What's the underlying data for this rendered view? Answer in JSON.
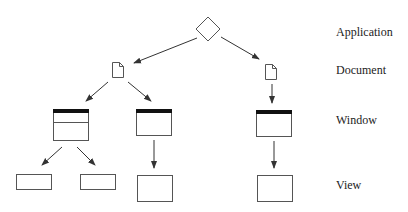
{
  "diagram": {
    "levels": [
      {
        "id": "application",
        "label": "Application",
        "y": 26
      },
      {
        "id": "document",
        "label": "Document",
        "y": 64
      },
      {
        "id": "window",
        "label": "Window",
        "y": 114
      },
      {
        "id": "view",
        "label": "View",
        "y": 179
      }
    ],
    "nodes": {
      "application": {
        "type": "diamond",
        "cx": 208,
        "cy": 29
      },
      "documents": [
        {
          "x": 111,
          "y": 61
        },
        {
          "x": 265,
          "y": 64
        }
      ],
      "windows": [
        {
          "x": 53,
          "y": 109,
          "w": 35,
          "h": 31,
          "panes": 3
        },
        {
          "x": 136,
          "y": 109,
          "w": 36,
          "h": 27,
          "panes": 1
        },
        {
          "x": 256,
          "y": 110,
          "w": 36,
          "h": 27,
          "panes": 1
        }
      ],
      "views": [
        {
          "x": 16,
          "y": 174,
          "w": 36,
          "h": 15
        },
        {
          "x": 81,
          "y": 174,
          "w": 35,
          "h": 15
        },
        {
          "x": 137,
          "y": 175,
          "w": 35,
          "h": 27
        },
        {
          "x": 257,
          "y": 175,
          "w": 35,
          "h": 27
        }
      ]
    },
    "colors": {
      "stroke": "#555555",
      "titlebar": "#111111",
      "text": "#222222"
    }
  }
}
